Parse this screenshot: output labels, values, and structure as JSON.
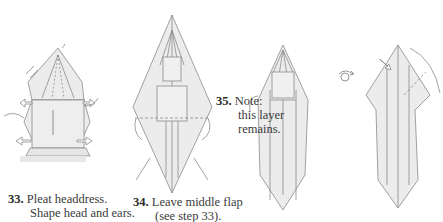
{
  "steps": [
    {
      "number": "33.",
      "line1": "Pleat headdress.",
      "line2": "Shape head and ears."
    },
    {
      "number": "34.",
      "line1": "Leave middle flap",
      "line2": "(see step 33)."
    },
    {
      "number": "35.",
      "line1": "Note:",
      "line2": "this layer",
      "line3": "remains."
    }
  ],
  "symbols": {
    "turn_over": "turn-over-symbol"
  },
  "colors": {
    "paper": "#ececec",
    "line": "#8a8a8a",
    "text": "#333333"
  }
}
